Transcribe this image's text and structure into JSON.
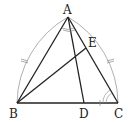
{
  "diagram": {
    "type": "geometry",
    "points": {
      "A": {
        "label": "A",
        "x": 68,
        "y": 17
      },
      "B": {
        "label": "B",
        "x": 17,
        "y": 103
      },
      "C": {
        "label": "C",
        "x": 118,
        "y": 103
      },
      "D": {
        "label": "D",
        "x": 84,
        "y": 103
      },
      "E": {
        "label": "E",
        "x": 86,
        "y": 48
      }
    },
    "segments": [
      "AB",
      "AC",
      "BC",
      "AD",
      "BE"
    ],
    "arcs": [
      {
        "center": "B",
        "from": "C",
        "to": "A",
        "note": "compass arc"
      },
      {
        "center": "C",
        "from": "B",
        "to": "A",
        "note": "compass arc"
      }
    ],
    "marks": {
      "equal_ticks": [
        "arc near AB",
        "arc near AC",
        "segment DC"
      ],
      "angle_marks": [
        "angle at A (between AD and AC)",
        "double arc at C"
      ]
    },
    "colors": {
      "line": "#222222",
      "arc": "#999999"
    }
  }
}
